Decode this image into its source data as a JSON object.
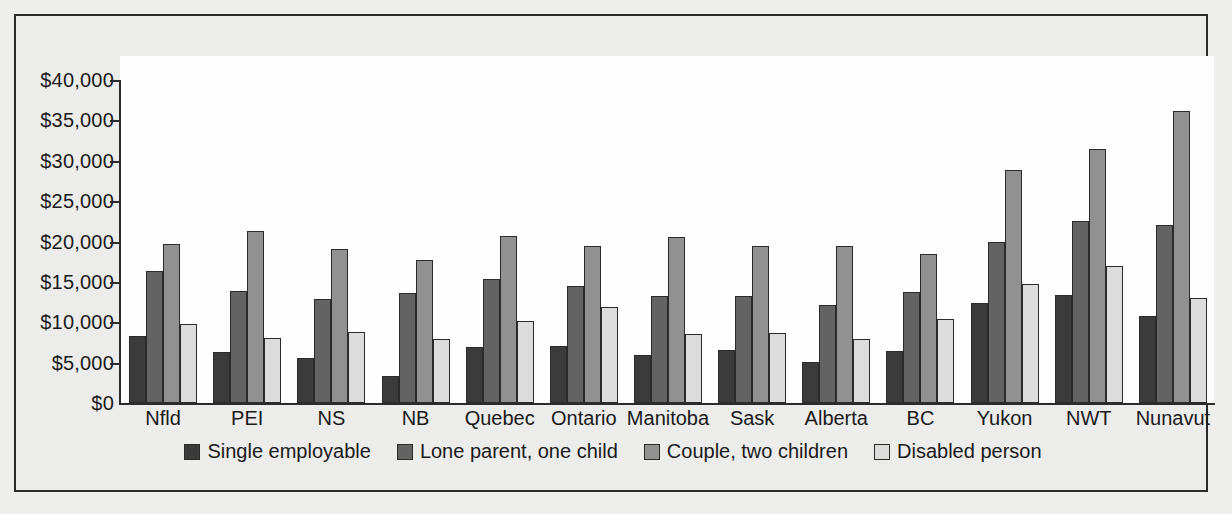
{
  "chart_data": {
    "type": "bar",
    "title": "",
    "subtitle": "",
    "xlabel": "",
    "ylabel": "",
    "ylim": [
      0,
      40000
    ],
    "ytick_values": [
      0,
      5000,
      10000,
      15000,
      20000,
      25000,
      30000,
      35000,
      40000
    ],
    "ytick_labels": [
      "$0",
      "$5,000",
      "$10,000",
      "$15,000",
      "$20,000",
      "$25,000",
      "$30,000",
      "$35,000",
      "$40,000"
    ],
    "grid": false,
    "legend_position": "bottom",
    "categories": [
      "Nfld",
      "PEI",
      "NS",
      "NB",
      "Quebec",
      "Ontario",
      "Manitoba",
      "Sask",
      "Alberta",
      "BC",
      "Yukon",
      "NWT",
      "Nunavut"
    ],
    "series": [
      {
        "name": "Single employable",
        "color": "#3b3b3b",
        "values": [
          8300,
          6300,
          5600,
          3400,
          6900,
          7100,
          5900,
          6600,
          5100,
          6400,
          12400,
          13400,
          10800
        ]
      },
      {
        "name": "Lone parent, one child",
        "color": "#636363",
        "values": [
          16300,
          13900,
          12900,
          13600,
          15400,
          14500,
          13200,
          13200,
          12200,
          13800,
          19900,
          22600,
          22000
        ]
      },
      {
        "name": "Couple, two children",
        "color": "#919191",
        "values": [
          19700,
          21300,
          19100,
          17700,
          20700,
          19400,
          20500,
          19400,
          19500,
          18400,
          28800,
          31500,
          36200
        ]
      },
      {
        "name": "Disabled person",
        "color": "#dcdcdc",
        "values": [
          9800,
          8100,
          8800,
          7900,
          10100,
          11900,
          8600,
          8700,
          7900,
          10400,
          14700,
          17000,
          13000
        ]
      }
    ]
  },
  "legend": {
    "items": [
      {
        "label": "Single employable",
        "color": "#3b3b3b"
      },
      {
        "label": "Lone parent, one child",
        "color": "#636363"
      },
      {
        "label": "Couple, two children",
        "color": "#919191"
      },
      {
        "label": "Disabled person",
        "color": "#dcdcdc"
      }
    ]
  },
  "colors": {
    "background": "#eeeeec",
    "plot_background": "#fdfdfd",
    "frame_border": "#2b2b2b",
    "axis": "#2b2b2b",
    "text": "#1a1a1a"
  }
}
